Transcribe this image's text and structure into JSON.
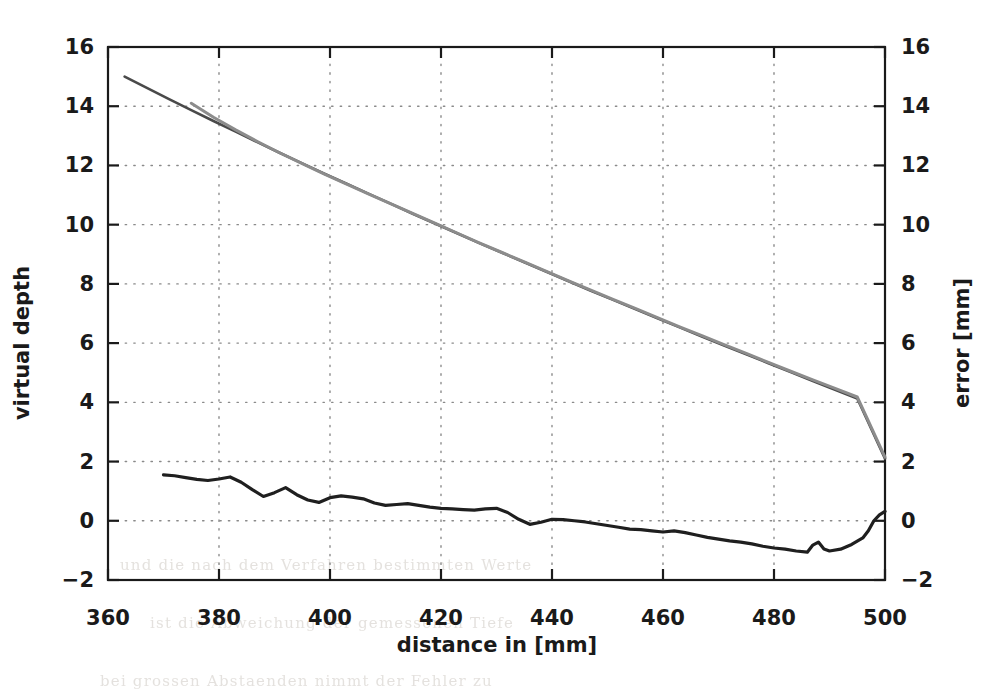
{
  "chart_data": {
    "type": "line",
    "title": "",
    "subtitle": "",
    "xlabel": "distance in [mm]",
    "ylabel": "virtual depth",
    "y2label": "error [mm]",
    "xlim": [
      360,
      500
    ],
    "ylim": [
      -2,
      16
    ],
    "y2lim": [
      -2,
      16
    ],
    "xticks": [
      360,
      380,
      400,
      420,
      440,
      460,
      480,
      500
    ],
    "yticks": [
      -2,
      0,
      2,
      4,
      6,
      8,
      10,
      12,
      14,
      16
    ],
    "y2ticks": [
      -2,
      0,
      2,
      4,
      6,
      8,
      10,
      12,
      14,
      16
    ],
    "xtick_labels": [
      "360",
      "380",
      "400",
      "420",
      "440",
      "460",
      "480",
      "500"
    ],
    "ytick_labels": [
      "-2",
      "0",
      "2",
      "4",
      "6",
      "8",
      "10",
      "12",
      "14",
      "16"
    ],
    "y2tick_labels": [
      "-2",
      "0",
      "2",
      "4",
      "6",
      "8",
      "10",
      "12",
      "14",
      "16"
    ],
    "grid": true,
    "grid_style": "dotted",
    "legend": "none",
    "series": [
      {
        "name": "virtual depth (reference)",
        "axis": "left",
        "color": "#4a4a4a",
        "width": 2.6,
        "points": [
          [
            363.0,
            15.0
          ],
          [
            367.0,
            14.62
          ],
          [
            371.0,
            14.24
          ],
          [
            375.0,
            13.87
          ],
          [
            379.0,
            13.5
          ],
          [
            383.0,
            13.14
          ],
          [
            387.0,
            12.78
          ],
          [
            391.0,
            12.42
          ],
          [
            395.0,
            12.07
          ],
          [
            399.0,
            11.72
          ],
          [
            403.0,
            11.38
          ],
          [
            407.0,
            11.04
          ],
          [
            411.0,
            10.7
          ],
          [
            415.0,
            10.36
          ],
          [
            419.0,
            10.03
          ],
          [
            423.0,
            9.7
          ],
          [
            427.0,
            9.37
          ],
          [
            431.0,
            9.05
          ],
          [
            435.0,
            8.73
          ],
          [
            439.0,
            8.41
          ],
          [
            443.0,
            8.09
          ],
          [
            447.0,
            7.77
          ],
          [
            451.0,
            7.46
          ],
          [
            455.0,
            7.15
          ],
          [
            459.0,
            6.84
          ],
          [
            463.0,
            6.53
          ],
          [
            467.0,
            6.22
          ],
          [
            471.0,
            5.92
          ],
          [
            475.0,
            5.62
          ],
          [
            479.0,
            5.32
          ],
          [
            483.0,
            5.02
          ],
          [
            487.0,
            4.72
          ],
          [
            491.0,
            4.42
          ],
          [
            495.0,
            4.13
          ],
          [
            500.0,
            2.1
          ]
        ]
      },
      {
        "name": "virtual depth (measured)",
        "axis": "left",
        "color": "#8c8c8c",
        "width": 3.0,
        "points": [
          [
            375.0,
            14.1
          ],
          [
            379.0,
            13.63
          ],
          [
            383.0,
            13.2
          ],
          [
            387.0,
            12.8
          ],
          [
            391.0,
            12.42
          ],
          [
            395.0,
            12.06
          ],
          [
            399.0,
            11.71
          ],
          [
            403.0,
            11.37
          ],
          [
            407.0,
            11.03
          ],
          [
            411.0,
            10.7
          ],
          [
            415.0,
            10.37
          ],
          [
            419.0,
            10.04
          ],
          [
            423.0,
            9.71
          ],
          [
            427.0,
            9.38
          ],
          [
            431.0,
            9.06
          ],
          [
            435.0,
            8.74
          ],
          [
            439.0,
            8.42
          ],
          [
            443.0,
            8.1
          ],
          [
            447.0,
            7.79
          ],
          [
            451.0,
            7.48
          ],
          [
            455.0,
            7.17
          ],
          [
            459.0,
            6.86
          ],
          [
            463.0,
            6.55
          ],
          [
            467.0,
            6.25
          ],
          [
            471.0,
            5.95
          ],
          [
            475.0,
            5.65
          ],
          [
            479.0,
            5.35
          ],
          [
            483.0,
            5.05
          ],
          [
            487.0,
            4.76
          ],
          [
            491.0,
            4.47
          ],
          [
            495.0,
            4.18
          ],
          [
            500.0,
            2.15
          ]
        ]
      },
      {
        "name": "error",
        "axis": "right",
        "color": "#1f1f1f",
        "width": 3.2,
        "points": [
          [
            370.0,
            1.55
          ],
          [
            372.0,
            1.52
          ],
          [
            374.0,
            1.46
          ],
          [
            376.0,
            1.4
          ],
          [
            378.0,
            1.36
          ],
          [
            380.0,
            1.41
          ],
          [
            382.0,
            1.48
          ],
          [
            384.0,
            1.3
          ],
          [
            386.0,
            1.05
          ],
          [
            388.0,
            0.82
          ],
          [
            390.0,
            0.95
          ],
          [
            392.0,
            1.12
          ],
          [
            394.0,
            0.88
          ],
          [
            396.0,
            0.7
          ],
          [
            398.0,
            0.62
          ],
          [
            400.0,
            0.78
          ],
          [
            402.0,
            0.84
          ],
          [
            404.0,
            0.8
          ],
          [
            406.0,
            0.74
          ],
          [
            408.0,
            0.6
          ],
          [
            410.0,
            0.52
          ],
          [
            412.0,
            0.55
          ],
          [
            414.0,
            0.58
          ],
          [
            416.0,
            0.52
          ],
          [
            418.0,
            0.46
          ],
          [
            420.0,
            0.42
          ],
          [
            422.0,
            0.4
          ],
          [
            424.0,
            0.38
          ],
          [
            426.0,
            0.36
          ],
          [
            428.0,
            0.4
          ],
          [
            430.0,
            0.42
          ],
          [
            432.0,
            0.28
          ],
          [
            434.0,
            0.05
          ],
          [
            436.0,
            -0.12
          ],
          [
            438.0,
            -0.05
          ],
          [
            440.0,
            0.05
          ],
          [
            442.0,
            0.04
          ],
          [
            444.0,
            0.0
          ],
          [
            446.0,
            -0.04
          ],
          [
            448.0,
            -0.1
          ],
          [
            450.0,
            -0.16
          ],
          [
            452.0,
            -0.22
          ],
          [
            454.0,
            -0.28
          ],
          [
            456.0,
            -0.3
          ],
          [
            458.0,
            -0.34
          ],
          [
            460.0,
            -0.38
          ],
          [
            462.0,
            -0.34
          ],
          [
            464.0,
            -0.4
          ],
          [
            466.0,
            -0.48
          ],
          [
            468.0,
            -0.56
          ],
          [
            470.0,
            -0.62
          ],
          [
            472.0,
            -0.68
          ],
          [
            474.0,
            -0.72
          ],
          [
            476.0,
            -0.78
          ],
          [
            478.0,
            -0.86
          ],
          [
            480.0,
            -0.92
          ],
          [
            482.0,
            -0.96
          ],
          [
            484.0,
            -1.02
          ],
          [
            486.0,
            -1.06
          ],
          [
            487.0,
            -0.82
          ],
          [
            488.0,
            -0.72
          ],
          [
            489.0,
            -0.95
          ],
          [
            490.0,
            -1.02
          ],
          [
            492.0,
            -0.96
          ],
          [
            494.0,
            -0.8
          ],
          [
            496.0,
            -0.58
          ],
          [
            497.0,
            -0.34
          ],
          [
            498.0,
            0.0
          ],
          [
            499.0,
            0.2
          ],
          [
            500.0,
            0.32
          ]
        ]
      }
    ]
  },
  "axes": {
    "x_title": "distance in [mm]",
    "y_left_title": "virtual depth",
    "y_right_title": "error [mm]"
  },
  "background_text": {
    "lines": [
      "und die nach dem Verfahren bestimmten Werte",
      "ist die Abweichung der gemessenen Tiefe",
      "bei grossen Abstaenden nimmt der Fehler zu"
    ]
  }
}
